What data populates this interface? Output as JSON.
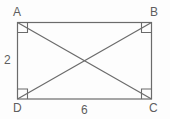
{
  "figure": {
    "type": "geometry-diagram",
    "shape": "rectangle",
    "stroke_color": "#6b6b6b",
    "background_color": "#fdfdfd",
    "label_color": "#5e5e5e",
    "vertices": {
      "top_left": "A",
      "top_right": "B",
      "bottom_right": "C",
      "bottom_left": "D"
    },
    "measurements": {
      "left_side": "2",
      "bottom_side": "6"
    },
    "right_angle_marks": 4,
    "diagonals": [
      "A-C",
      "B-D"
    ]
  },
  "labels": {
    "A": "A",
    "B": "B",
    "C": "C",
    "D": "D",
    "side_left": "2",
    "side_bottom": "6"
  }
}
